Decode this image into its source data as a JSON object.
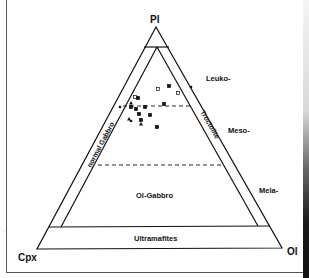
{
  "figure": {
    "header_fragment": "· · ·",
    "vertices": {
      "top": "Pl",
      "bottom_left": "Cpx",
      "bottom_right": "Ol"
    },
    "side_labels": {
      "leuko": "Leuko-",
      "meso": "Meso-",
      "mela": "Mela-"
    },
    "band_labels": {
      "left": "normal Gabbro",
      "right": "Troctolite"
    },
    "field_labels": {
      "ol_gabbro": "Ol-Gabbro",
      "ultramafites": "Ultramafites"
    },
    "left_margin_mark": "·,"
  },
  "chart_data": {
    "type": "scatter",
    "subtype": "ternary",
    "title": "",
    "axes": [
      "Pl",
      "Cpx",
      "Ol"
    ],
    "fields": [
      "Leuko-",
      "Meso-",
      "Mela-",
      "normal Gabbro",
      "Troctolite",
      "Ol-Gabbro",
      "Ultramafites"
    ],
    "points_px": [
      {
        "x": 158,
        "y": 89,
        "marker": "open-square"
      },
      {
        "x": 169,
        "y": 86,
        "marker": "filled-square"
      },
      {
        "x": 178,
        "y": 93,
        "marker": "open-square"
      },
      {
        "x": 191,
        "y": 87,
        "marker": "filled-circle"
      },
      {
        "x": 135,
        "y": 97,
        "marker": "open-square"
      },
      {
        "x": 138,
        "y": 98,
        "marker": "filled-square"
      },
      {
        "x": 131,
        "y": 103,
        "marker": "filled-triangle"
      },
      {
        "x": 120,
        "y": 107,
        "marker": "filled-circle"
      },
      {
        "x": 131,
        "y": 107,
        "marker": "filled-square"
      },
      {
        "x": 136,
        "y": 109,
        "marker": "filled-square"
      },
      {
        "x": 145,
        "y": 107,
        "marker": "filled-square"
      },
      {
        "x": 164,
        "y": 104,
        "marker": "filled-square"
      },
      {
        "x": 139,
        "y": 114,
        "marker": "filled-square"
      },
      {
        "x": 150,
        "y": 115,
        "marker": "filled-square"
      },
      {
        "x": 129,
        "y": 119,
        "marker": "filled-triangle"
      },
      {
        "x": 131,
        "y": 121,
        "marker": "filled-circle"
      },
      {
        "x": 141,
        "y": 120,
        "marker": "filled-square"
      },
      {
        "x": 141,
        "y": 124,
        "marker": "filled-triangle"
      },
      {
        "x": 157,
        "y": 127,
        "marker": "filled-square"
      }
    ],
    "grid": false,
    "legend": null
  }
}
